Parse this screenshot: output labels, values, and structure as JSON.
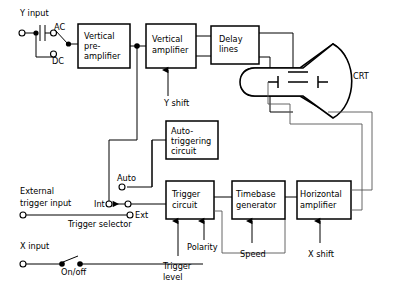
{
  "diagram": {
    "blocks": [
      {
        "id": "vertical_preamplifier",
        "label_lines": [
          "Vertical",
          "pre-",
          "amplifier"
        ],
        "x": 78,
        "y": 24,
        "w": 52,
        "h": 44
      },
      {
        "id": "vertical_amplifier",
        "label_lines": [
          "Vertical",
          "amplifier"
        ],
        "x": 146,
        "y": 24,
        "w": 50,
        "h": 44
      },
      {
        "id": "delay_lines",
        "label_lines": [
          "Delay",
          "lines"
        ],
        "x": 211,
        "y": 26,
        "w": 48,
        "h": 38
      },
      {
        "id": "auto_triggering_circuit",
        "label_lines": [
          "Auto-",
          "triggering",
          "circuit"
        ],
        "x": 166,
        "y": 121,
        "w": 52,
        "h": 38
      },
      {
        "id": "trigger_circuit",
        "label_lines": [
          "Trigger",
          "circuit"
        ],
        "x": 166,
        "y": 181,
        "w": 48,
        "h": 38
      },
      {
        "id": "timebase_generator",
        "label_lines": [
          "Timebase",
          "generator"
        ],
        "x": 232,
        "y": 181,
        "w": 53,
        "h": 38
      },
      {
        "id": "horizontal_amplifier",
        "label_lines": [
          "Horizontal",
          "amplifier"
        ],
        "x": 297,
        "y": 181,
        "w": 54,
        "h": 38
      }
    ],
    "crt": {
      "label": "CRT",
      "label_x": 353,
      "label_y": 79
    },
    "terminals": [
      {
        "id": "y_input",
        "label": "Y input",
        "label_x": 20,
        "label_y": 16
      },
      {
        "id": "ac_position",
        "label": "AC",
        "label_x": 54,
        "label_y": 30
      },
      {
        "id": "dc_position",
        "label": "DC",
        "label_x": 52,
        "label_y": 64
      },
      {
        "id": "external_trigger_input",
        "label_lines": [
          "External",
          "trigger input"
        ],
        "label_x": 20,
        "label_y": 194
      },
      {
        "id": "auto_terminal",
        "label": "Auto",
        "label_x": 117,
        "label_y": 181
      },
      {
        "id": "int_terminal",
        "label": "Int",
        "label_x": 94,
        "label_y": 204
      },
      {
        "id": "ext_terminal",
        "label": "Ext",
        "label_x": 131,
        "label_y": 215
      },
      {
        "id": "trigger_selector",
        "label": "Trigger selector",
        "label_x": 68,
        "label_y": 227
      },
      {
        "id": "x_input",
        "label": "X input",
        "label_x": 20,
        "label_y": 249
      },
      {
        "id": "on_off_switch",
        "label": "On/off",
        "label_x": 61,
        "label_y": 272
      }
    ],
    "controls": [
      {
        "id": "y_shift",
        "label": "Y shift",
        "label_x": 164,
        "label_y": 106
      },
      {
        "id": "trigger_level",
        "label_lines": [
          "Trigger",
          "level"
        ],
        "label_x": 163,
        "label_y": 269
      },
      {
        "id": "polarity",
        "label": "Polarity",
        "label_x": 187,
        "label_y": 247
      },
      {
        "id": "speed",
        "label": "Speed",
        "label_x": 243,
        "label_y": 257
      },
      {
        "id": "x_shift",
        "label": "X shift",
        "label_x": 310,
        "label_y": 257
      }
    ],
    "colors": {
      "background": "#ffffff",
      "stroke": "#000000",
      "thin_stroke": "#555555"
    }
  }
}
